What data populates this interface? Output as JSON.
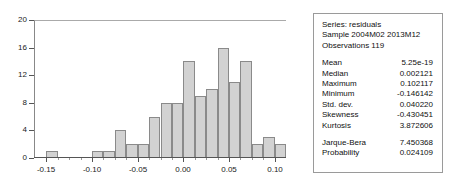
{
  "chart_data": {
    "type": "bar",
    "title": "",
    "xlabel": "",
    "ylabel": "",
    "grid": false,
    "legend_position": "none",
    "ylim": [
      0,
      20
    ],
    "xlim": [
      -0.1625,
      0.1125
    ],
    "ytick_labels": [
      "20",
      "16",
      "12",
      "8",
      "4",
      "0"
    ],
    "ytick_values": [
      20,
      16,
      12,
      8,
      4,
      0
    ],
    "xtick_labels": [
      "-0.15",
      "-0.10",
      "-0.05",
      "0.00",
      "0.05",
      "0.10"
    ],
    "xtick_values": [
      -0.15,
      -0.1,
      -0.05,
      0.0,
      0.05,
      0.1
    ],
    "bin_width": 0.0125,
    "categories": [
      "-0.1500",
      "-0.1375",
      "-0.1250",
      "-0.1125",
      "-0.1000",
      "-0.0875",
      "-0.0750",
      "-0.0625",
      "-0.0500",
      "-0.0375",
      "-0.0250",
      "-0.0125",
      "0.0000",
      "0.0125",
      "0.0250",
      "0.0375",
      "0.0500",
      "0.0625",
      "0.0750",
      "0.0875",
      "0.1000"
    ],
    "bin_left_edges": [
      -0.15,
      -0.1375,
      -0.125,
      -0.1125,
      -0.1,
      -0.0875,
      -0.075,
      -0.0625,
      -0.05,
      -0.0375,
      -0.025,
      -0.0125,
      0.0,
      0.0125,
      0.025,
      0.0375,
      0.05,
      0.0625,
      0.075,
      0.0875,
      0.1
    ],
    "values": [
      1,
      0,
      0,
      0,
      1,
      1,
      4,
      2,
      2,
      6,
      8,
      8,
      14,
      9,
      10,
      16,
      11,
      14,
      2,
      3,
      2
    ],
    "series": [
      {
        "name": "residuals",
        "values": [
          1,
          0,
          0,
          0,
          1,
          1,
          4,
          2,
          2,
          6,
          8,
          8,
          14,
          9,
          10,
          16,
          11,
          14,
          2,
          3,
          2
        ]
      }
    ],
    "bar_fill_color": "#d2d2d2",
    "bar_border_color": "#8a8a8a"
  },
  "stats_panel": {
    "header_lines": [
      "Series: residuals",
      "Sample 2004M02 2013M12",
      "Observations 119"
    ],
    "series_name": "residuals",
    "sample": "2004M02 2013M12",
    "observations": "119",
    "rows": [
      {
        "key": "Mean",
        "value": "5.25e-19"
      },
      {
        "key": "Median",
        "value": "0.002121"
      },
      {
        "key": "Maximum",
        "value": "0.102117"
      },
      {
        "key": "Minimum",
        "value": "-0.146142"
      },
      {
        "key": "Std. dev.",
        "value": "0.040220"
      },
      {
        "key": "Skewness",
        "value": "-0.430451"
      },
      {
        "key": "Kurtosis",
        "value": "3.872606"
      }
    ],
    "test_rows": [
      {
        "key": "Jarque-Bera",
        "value": "7.450368"
      },
      {
        "key": "Probability",
        "value": "0.024109"
      }
    ]
  }
}
